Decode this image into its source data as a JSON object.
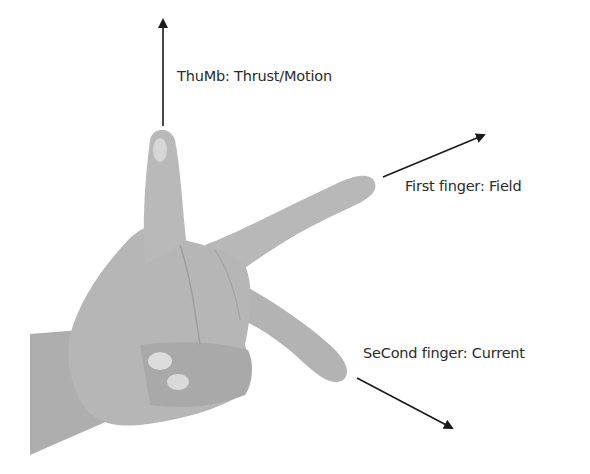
{
  "diagram": {
    "labels": {
      "thumb": "ThuMb: Thrust/Motion",
      "first_finger": "First finger: Field",
      "second_finger": "SeCond finger: Current"
    },
    "arrows": [
      {
        "name": "thrust-arrow",
        "direction": "up"
      },
      {
        "name": "field-arrow",
        "direction": "up-right"
      },
      {
        "name": "current-arrow",
        "direction": "down-right"
      }
    ],
    "colors": {
      "background": "#ffffff",
      "hand": "#b5b5b5",
      "hand_shadow": "#9e9e9e",
      "nail": "#d9d9d9",
      "arrow": "#1a1a1a",
      "text": "#2b2b2b"
    }
  }
}
